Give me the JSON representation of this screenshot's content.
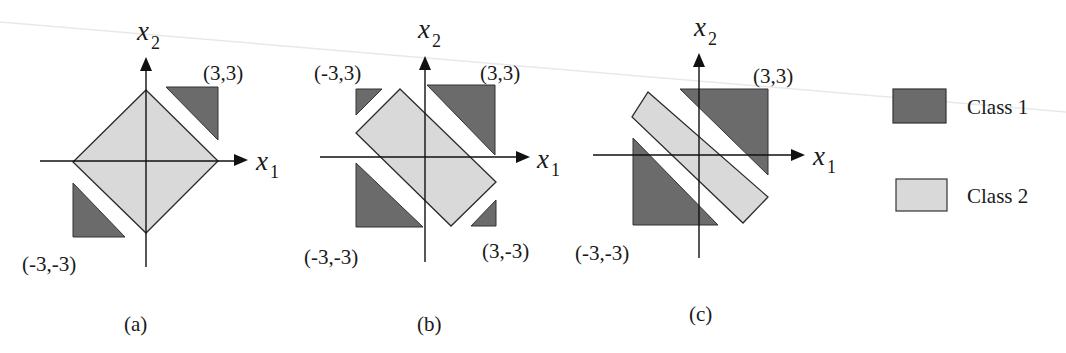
{
  "colors": {
    "class1_fill": "#6b6b6b",
    "class2_fill": "#d9d9d9",
    "stroke": "#2a2a2a",
    "axis": "#111111",
    "scan_line": "#e6e6e6"
  },
  "legend": {
    "items": [
      {
        "label": "Class 1",
        "fill_key": "class1_fill"
      },
      {
        "label": "Class 2",
        "fill_key": "class2_fill"
      }
    ]
  },
  "panels": [
    {
      "id": "a",
      "caption": "(a)",
      "axis_x_label": "x",
      "axis_x_sub": "1",
      "axis_y_label": "x",
      "axis_y_sub": "2",
      "corner_labels": [
        "(3,3)",
        "(-3,-3)"
      ]
    },
    {
      "id": "b",
      "caption": "(b)",
      "axis_x_label": "x",
      "axis_x_sub": "1",
      "axis_y_label": "x",
      "axis_y_sub": "2",
      "corner_labels": [
        "(-3,3)",
        "(3,3)",
        "(-3,-3)",
        "(3,-3)"
      ]
    },
    {
      "id": "c",
      "caption": "(c)",
      "axis_x_label": "x",
      "axis_x_sub": "1",
      "axis_y_label": "x",
      "axis_y_sub": "2",
      "corner_labels": [
        "(3,3)",
        "(-3,-3)"
      ]
    }
  ]
}
